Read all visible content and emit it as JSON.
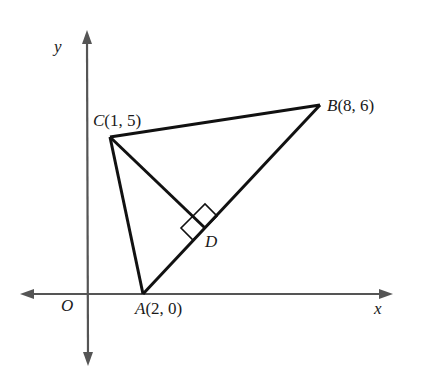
{
  "diagram": {
    "axes": {
      "x_label": "x",
      "y_label": "y",
      "origin_label": "O"
    },
    "points": {
      "A": {
        "name": "A",
        "coords": "(2, 0)"
      },
      "B": {
        "name": "B",
        "coords": "(8, 6)"
      },
      "C": {
        "name": "C",
        "coords": "(1, 5)"
      },
      "D": {
        "name": "D",
        "coords": ""
      }
    },
    "annotations": {
      "right_angle_at": "D",
      "perpendicular": "CD ⟂ AB"
    },
    "colors": {
      "axis": "#555555",
      "line": "#111111",
      "text": "#1a1a1a"
    }
  }
}
